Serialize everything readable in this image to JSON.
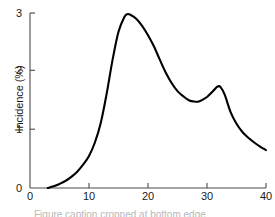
{
  "chart_data": {
    "type": "line",
    "title": "",
    "xlabel": "",
    "ylabel": "Incidence (%)",
    "xlim": [
      0,
      40
    ],
    "ylim": [
      0,
      3
    ],
    "grid": false,
    "legend": "none",
    "series": [
      {
        "name": "Incidence",
        "color": "#000000",
        "x": [
          3,
          4,
          5,
          6,
          7,
          8,
          9,
          10,
          11,
          12,
          13,
          14,
          15,
          16,
          16.5,
          17,
          18,
          19,
          20,
          21,
          22,
          23,
          24,
          25,
          26,
          27,
          28,
          28.5,
          29,
          30,
          31,
          31.8,
          32.3,
          33,
          34,
          35,
          36,
          37,
          38,
          39,
          40
        ],
        "y": [
          0.0,
          0.03,
          0.07,
          0.12,
          0.19,
          0.28,
          0.4,
          0.55,
          0.78,
          1.12,
          1.62,
          2.2,
          2.68,
          2.93,
          2.98,
          2.97,
          2.9,
          2.78,
          2.62,
          2.43,
          2.2,
          1.98,
          1.8,
          1.66,
          1.57,
          1.5,
          1.48,
          1.48,
          1.5,
          1.56,
          1.66,
          1.74,
          1.73,
          1.6,
          1.3,
          1.1,
          0.96,
          0.86,
          0.78,
          0.71,
          0.65
        ]
      }
    ],
    "annotations": [
      {
        "label": "primary peak",
        "x": 16.5,
        "y": 2.98
      },
      {
        "label": "trough",
        "x": 28.5,
        "y": 1.48
      },
      {
        "label": "secondary peak",
        "x": 32,
        "y": 1.74
      },
      {
        "label": "onset",
        "x": 3,
        "y": 0.0
      },
      {
        "label": "endpoint",
        "x": 40,
        "y": 0.65
      }
    ]
  },
  "axes": {
    "y_ticks": [
      {
        "value": 0,
        "label": "0"
      },
      {
        "value": 1,
        "label": "1"
      },
      {
        "value": 2,
        "label": "2"
      },
      {
        "value": 3,
        "label": "3"
      }
    ],
    "x_ticks": [
      {
        "value": 0,
        "label": "0"
      },
      {
        "value": 10,
        "label": "10"
      },
      {
        "value": 20,
        "label": "20"
      },
      {
        "value": 30,
        "label": "30"
      },
      {
        "value": 40,
        "label": "40"
      }
    ],
    "axis_color": "#4a4a4a",
    "line_color": "#000000"
  },
  "caption": {
    "cropped_text": "Figure caption cropped at bottom edge"
  }
}
